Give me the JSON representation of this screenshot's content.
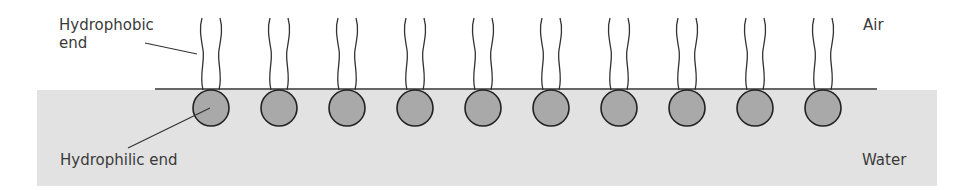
{
  "diagram": {
    "labels": {
      "hydrophobic": "Hydrophobic\nend",
      "hydrophilic": "Hydrophilic end",
      "air": "Air",
      "water": "Water"
    },
    "molecule_count": 10,
    "molecule_centers_x": [
      211,
      279,
      347,
      415,
      483,
      551,
      619,
      687,
      755,
      823
    ],
    "colors": {
      "water": "#e2e2e2",
      "head": "#a9a9a9",
      "stroke": "#333333",
      "text": "#3a3a3a"
    }
  }
}
